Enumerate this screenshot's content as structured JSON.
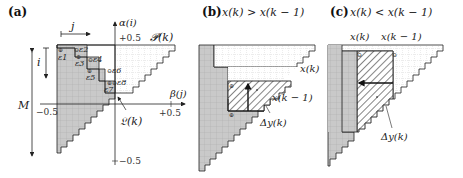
{
  "panels": [
    {
      "id": "a",
      "tag": "(a)",
      "axis_labels": {
        "j": "j",
        "i": "i",
        "M": "M",
        "alpha": "α(i)",
        "beta": "β(j)",
        "P": "𝓟(k)",
        "L": "𝔏(k)"
      },
      "ticks": {
        "top": "+0.5",
        "left": "−0.5",
        "right": "+0.5",
        "bottom": "−0.5"
      },
      "epsilon_labels": [
        "ε1",
        "ε2",
        "ε3",
        "ε4",
        "ε5",
        "ε6",
        "ε7",
        "ε8"
      ]
    },
    {
      "id": "b",
      "tag": "(b)",
      "title": "x(k) > x(k − 1)",
      "labels": {
        "xk": "x(k)",
        "xk1": "x(k − 1)",
        "dy": "Δy(k)"
      }
    },
    {
      "id": "c",
      "tag": "(c)",
      "title": "x(k) < x(k − 1)",
      "labels": {
        "xk": "x(k)",
        "xk1": "x(k − 1)",
        "dy": "Δy(k)"
      }
    }
  ],
  "colors": {
    "gray_fill": "#c8c8c8",
    "grid_line": "#9a9a9a",
    "outline": "#222222",
    "hatch": "#333333"
  }
}
